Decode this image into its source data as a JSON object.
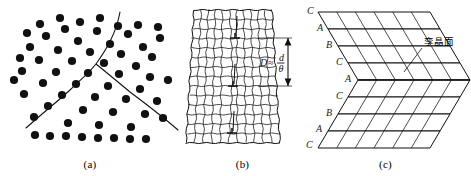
{
  "figure": {
    "width": 471,
    "height": 176,
    "background": "#ffffff",
    "ink": "#111111"
  },
  "panels": [
    {
      "id": "a",
      "caption": "(a)",
      "description": "grain-boundary dot model"
    },
    {
      "id": "b",
      "caption": "(b)",
      "description": "small-angle tilt boundary lattice with edge dislocations"
    },
    {
      "id": "c",
      "caption": "(c)",
      "description": "twin boundary stacking sequence block"
    }
  ],
  "panel_a": {
    "caption": "(a)",
    "dot_color": "#111111",
    "dot_radius": 4.1,
    "dots": [
      [
        22,
        71
      ],
      [
        24,
        94
      ],
      [
        30,
        47
      ],
      [
        34,
        117
      ],
      [
        39,
        60
      ],
      [
        43,
        83
      ],
      [
        46,
        36
      ],
      [
        48,
        106
      ],
      [
        56,
        72
      ],
      [
        58,
        50
      ],
      [
        62,
        95
      ],
      [
        65,
        29
      ],
      [
        68,
        123
      ],
      [
        72,
        61
      ],
      [
        76,
        84
      ],
      [
        78,
        41
      ],
      [
        83,
        110
      ],
      [
        88,
        73
      ],
      [
        90,
        52
      ],
      [
        95,
        97
      ],
      [
        97,
        31
      ],
      [
        99,
        125
      ],
      [
        104,
        63
      ],
      [
        108,
        86
      ],
      [
        110,
        44
      ],
      [
        113,
        112
      ],
      [
        119,
        74
      ],
      [
        121,
        54
      ],
      [
        126,
        99
      ],
      [
        128,
        34
      ],
      [
        131,
        127
      ],
      [
        136,
        66
      ],
      [
        140,
        89
      ],
      [
        143,
        47
      ],
      [
        145,
        114
      ],
      [
        150,
        77
      ],
      [
        152,
        57
      ],
      [
        157,
        101
      ],
      [
        160,
        38
      ],
      [
        163,
        118
      ],
      [
        168,
        80
      ],
      [
        35,
        135
      ],
      [
        50,
        136
      ],
      [
        66,
        136
      ],
      [
        82,
        137
      ],
      [
        98,
        138
      ],
      [
        114,
        138
      ],
      [
        130,
        139
      ],
      [
        146,
        139
      ],
      [
        20,
        58
      ],
      [
        14,
        80
      ],
      [
        27,
        33
      ],
      [
        118,
        26
      ],
      [
        138,
        25
      ],
      [
        158,
        27
      ],
      [
        100,
        18
      ],
      [
        80,
        22
      ],
      [
        60,
        18
      ],
      [
        40,
        24
      ]
    ],
    "boundary_curves": [
      "M 120 12 C 116 34, 106 50, 96 64 C 88 74, 78 82, 70 90 C 58 101, 44 112, 26 128",
      "M 96 64 C 106 72, 118 82, 130 92 C 146 104, 162 116, 178 130"
    ]
  },
  "panel_b": {
    "caption": "(b)",
    "grid_rows": 14,
    "grid_cols": 11,
    "outline": {
      "top_left": [
        14,
        10
      ],
      "top_right": [
        92,
        10
      ],
      "bottom_right": [
        100,
        143
      ],
      "bottom_left": [
        6,
        143
      ]
    },
    "dislocations": [
      {
        "x": 55,
        "y": 38
      },
      {
        "x": 53,
        "y": 86
      },
      {
        "x": 52,
        "y": 133
      }
    ],
    "dimension": {
      "label_D": "D",
      "relation": "≈",
      "numerator": "d",
      "denominator": "θ",
      "arrow_top_y": 38,
      "arrow_bottom_y": 86,
      "arrow_x": 108
    }
  },
  "panel_c": {
    "caption": "(c)",
    "annotation": "孪晶面",
    "stacking_labels_upper": [
      "C",
      "A",
      "B",
      "C",
      "A"
    ],
    "stacking_labels_lower": [
      "C",
      "B",
      "A",
      "C"
    ],
    "stacking_sequence": [
      "C",
      "A",
      "B",
      "C",
      "A",
      "C",
      "B",
      "A",
      "C"
    ],
    "label_positions": [
      {
        "text": "C",
        "x": 7,
        "y": 14
      },
      {
        "text": "A",
        "x": 17,
        "y": 31
      },
      {
        "text": "B",
        "x": 26,
        "y": 48
      },
      {
        "text": "C",
        "x": 36,
        "y": 65
      },
      {
        "text": "A",
        "x": 45,
        "y": 82
      },
      {
        "text": "C",
        "x": 36,
        "y": 99
      },
      {
        "text": "B",
        "x": 26,
        "y": 116
      },
      {
        "text": "A",
        "x": 16,
        "y": 132
      },
      {
        "text": "C",
        "x": 6,
        "y": 148
      }
    ],
    "annotation_x": 124,
    "annotation_y": 45,
    "leader_from": [
      122,
      48
    ],
    "leader_to": [
      104,
      72
    ]
  }
}
